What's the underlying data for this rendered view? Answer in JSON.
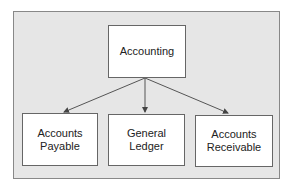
{
  "diagram": {
    "root": {
      "label": "Accounting"
    },
    "children": [
      {
        "line1": "Accounts",
        "line2": "Payable"
      },
      {
        "line1": "General",
        "line2": "Ledger"
      },
      {
        "line1": "Accounts",
        "line2": "Receivable"
      }
    ],
    "colors": {
      "background": "#e6e6e6",
      "node_fill": "#ffffff",
      "border": "#666666",
      "arrow": "#555555"
    }
  }
}
